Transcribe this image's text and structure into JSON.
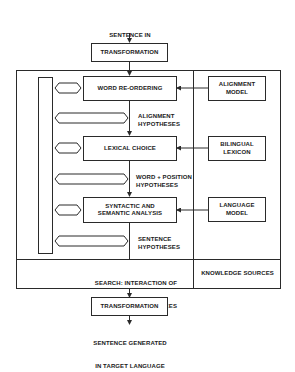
{
  "diagram": {
    "input": {
      "line1": "SENTENCE IN",
      "line2": "SOURCE LANGUAGE"
    },
    "transformation_top": "TRANSFORMATION",
    "stages": [
      {
        "label": "WORD RE-ORDERING"
      },
      {
        "label": "LEXICAL CHOICE"
      },
      {
        "line1": "SYNTACTIC AND",
        "line2": "SEMANTIC ANALYSIS"
      }
    ],
    "hypotheses": [
      {
        "line1": "ALIGNMENT",
        "line2": "HYPOTHESES"
      },
      {
        "line1": "WORD + POSITION",
        "line2": "HYPOTHESES"
      },
      {
        "line1": "SENTENCE",
        "line2": "HYPOTHESES"
      }
    ],
    "knowledge": [
      {
        "line1": "ALIGNMENT",
        "line2": "MODEL"
      },
      {
        "line1": "BILINGUAL",
        "line2": "LEXICON"
      },
      {
        "line1": "LANGUAGE",
        "line2": "MODEL"
      }
    ],
    "footer": {
      "search_line1": "SEARCH: INTERACTION OF",
      "search_line2": "KNOWLEDGE SOURCES",
      "knowledge_sources": "KNOWLEDGE SOURCES"
    },
    "transformation_bottom": "TRANSFORMATION",
    "output": {
      "line1": "SENTENCE GENERATED",
      "line2": "IN TARGET LANGUAGE"
    }
  }
}
